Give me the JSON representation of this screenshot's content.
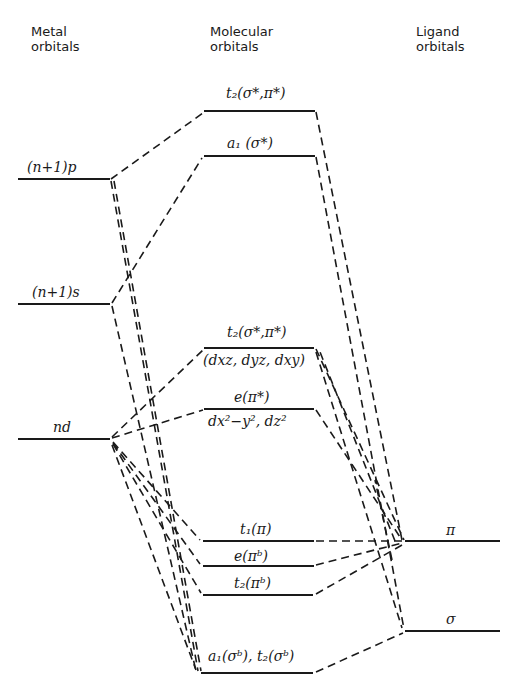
{
  "headers": {
    "metal": [
      "Metal",
      "orbitals"
    ],
    "molecular": [
      "Molecular",
      "orbitals"
    ],
    "ligand": [
      "Ligand",
      "orbitals"
    ]
  },
  "metal_levels": [
    {
      "id": "n1p",
      "label": "(n+1)p",
      "y": 179
    },
    {
      "id": "n1s",
      "label": "(n+1)s",
      "y": 304
    },
    {
      "id": "nd",
      "label": "nd",
      "y": 439
    }
  ],
  "mo_levels": [
    {
      "id": "t2_antibond_top",
      "label": "t₂(σ*,π*)",
      "y": 111
    },
    {
      "id": "a1_antibond",
      "label": "a₁ (σ*)",
      "y": 156
    },
    {
      "id": "t2_antibond_d",
      "label": "t₂(σ*,π*)",
      "sublabel": "(dxz, dyz, dxy)",
      "y": 348
    },
    {
      "id": "e_antibond",
      "label": "e(π*)",
      "sublabel": "dx²−y², dz²",
      "y": 409
    },
    {
      "id": "t1_nonbond",
      "label": "t₁(π)",
      "y": 541
    },
    {
      "id": "e_bond",
      "label": "e(πᵇ)",
      "y": 565
    },
    {
      "id": "t2_bond_pi",
      "label": "t₂(πᵇ)",
      "y": 595
    },
    {
      "id": "a1_t2_bond_sigma",
      "label": "a₁(σᵇ), t₂(σᵇ)",
      "y": 673
    }
  ],
  "ligand_levels": [
    {
      "id": "pi",
      "label": "π",
      "y": 541
    },
    {
      "id": "sigma",
      "label": "σ",
      "y": 631
    }
  ],
  "colors": {
    "line": "#1a1a1a",
    "background": "#ffffff"
  }
}
